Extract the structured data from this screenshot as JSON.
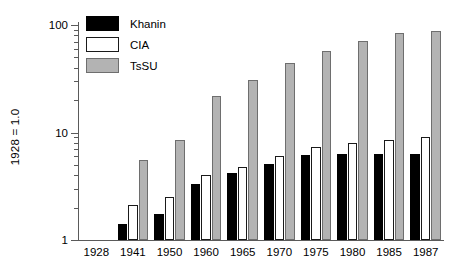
{
  "chart_data": {
    "type": "bar",
    "title": "",
    "subtitle": "",
    "xlabel": "",
    "ylabel": "1928 = 1.0",
    "yscale": "log",
    "ylim": [
      1,
      100
    ],
    "grid": false,
    "legend_position": "top-left",
    "y_major_ticks": [
      1,
      10,
      100
    ],
    "y_major_tick_labels": [
      "1",
      "10",
      "100"
    ],
    "y_minor_ticks": [
      2,
      3,
      4,
      5,
      6,
      7,
      8,
      9,
      20,
      30,
      40,
      50,
      60,
      70,
      80,
      90
    ],
    "categories": [
      "1928",
      "1941",
      "1950",
      "1960",
      "1965",
      "1970",
      "1975",
      "1980",
      "1985",
      "1987"
    ],
    "series": [
      {
        "name": "Khanin",
        "color": "#000000",
        "edge_color": "#000000",
        "values": [
          1.0,
          1.4,
          1.75,
          3.3,
          4.2,
          5.1,
          6.2,
          6.3,
          6.3,
          6.3
        ]
      },
      {
        "name": "CIA",
        "color": "#ffffff",
        "edge_color": "#1a1a1a",
        "values": [
          1.0,
          2.1,
          2.5,
          4.0,
          4.8,
          6.0,
          7.3,
          8.0,
          8.5,
          9.0
        ]
      },
      {
        "name": "TsSU",
        "color": "#b3b3b3",
        "edge_color": "#6e6e6e",
        "values": [
          1.0,
          5.5,
          8.5,
          22.0,
          31.0,
          44.0,
          57.0,
          71.0,
          84.0,
          88.0
        ]
      }
    ]
  },
  "legend": {
    "items": [
      {
        "label": "Khanin",
        "key": "khanin"
      },
      {
        "label": "CIA",
        "key": "cia"
      },
      {
        "label": "TsSU",
        "key": "tssu"
      }
    ]
  },
  "axes": {
    "y_title": "1928 = 1.0"
  }
}
